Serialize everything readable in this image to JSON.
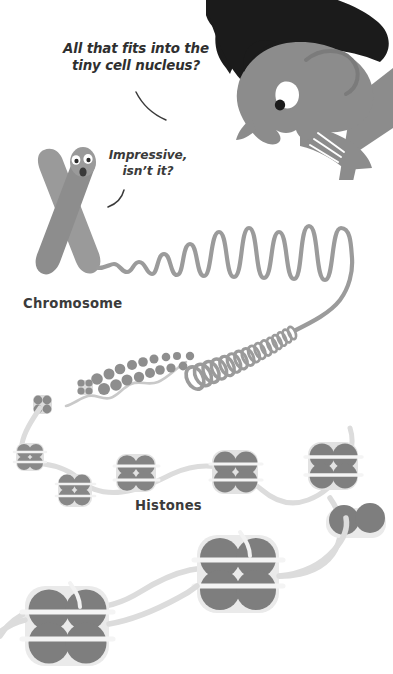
{
  "page": {
    "width": 393,
    "height": 674,
    "background": "#ffffff"
  },
  "palette": {
    "background": "#ffffff",
    "text": "#333333",
    "hair_dark": "#1b1b1b",
    "skin_gray": "#8c8c8c",
    "skin_shadow": "#7d7d7d",
    "chromosome_gray": "#9a9a9a",
    "chromosome_shadow": "#8d8d8d",
    "dna_strand": "#9b9b9b",
    "dna_light": "#dcdcdc",
    "histone_dark": "#7e7e7e",
    "histone_mid": "#8e8e8e",
    "histone_light": "#e2e2e2",
    "eye_white": "#ffffff",
    "pupil": "#1b1b1b",
    "pointer_line": "#3a3a3a"
  },
  "annotations": {
    "speech_nucleus": "All that fits into the\ntiny cell nucleus?",
    "speech_impressive": "Impressive,\nisn’t it?",
    "label_chromosome": "Chromosome",
    "label_histones": "Histones"
  },
  "figure": {
    "type": "illustration",
    "elements": [
      {
        "name": "person-head",
        "description": "cartoon head with dark hair peering from top-right corner"
      },
      {
        "name": "chromosome-character",
        "description": "X-shaped chromosome with two eyes and open mouth"
      },
      {
        "name": "chromatin-wave",
        "description": "wavy looping fibre increasing in amplitude to the right"
      },
      {
        "name": "solenoid-coil",
        "description": "tightly coiled 30nm fibre unwinding from right to left"
      },
      {
        "name": "beads-on-string",
        "description": "nucleosome beads of increasing size along the strand"
      },
      {
        "name": "histone-octamer",
        "description": "large histone cores with DNA wrapped around them"
      }
    ]
  }
}
